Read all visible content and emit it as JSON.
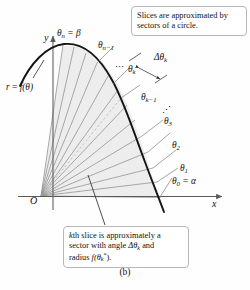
{
  "figure": {
    "caption": "(b)"
  },
  "callouts": {
    "top": "Slices are approximated by sectors of a circle.",
    "bottom_line1": "kth slice is approximately a",
    "bottom_line2_pre": "sector with angle ",
    "bottom_line2_delta": "Δθ",
    "bottom_line2_sub": "k",
    "bottom_line2_post": " and",
    "bottom_line3_pre": "radius ",
    "bottom_line3_f": "f",
    "bottom_line3_theta": "(θ",
    "bottom_line3_sub": "k",
    "bottom_line3_star": "*",
    "bottom_line3_post": ")."
  },
  "axes": {
    "x_label": "x",
    "y_label": "y",
    "origin_label": "O"
  },
  "curve": {
    "label_r": "r",
    "label_eq": " = ",
    "label_f": "f",
    "label_arg": "(θ)"
  },
  "ray_labels": [
    {
      "name": "theta-0",
      "base": "θ",
      "sub": "0",
      "tail": " = α"
    },
    {
      "name": "theta-1",
      "base": "θ",
      "sub": "1",
      "tail": ""
    },
    {
      "name": "theta-2",
      "base": "θ",
      "sub": "2",
      "tail": ""
    },
    {
      "name": "theta-3",
      "base": "θ",
      "sub": "3",
      "tail": ""
    },
    {
      "name": "theta-k-minus-1",
      "base": "θ",
      "sub": "k−1",
      "tail": ""
    },
    {
      "name": "theta-k",
      "base": "θ",
      "sub": "k",
      "tail": ""
    },
    {
      "name": "theta-n-minus-1",
      "base": "θ",
      "sub": "n−1",
      "tail": ""
    },
    {
      "name": "theta-n",
      "base": "θ",
      "sub": "n",
      "tail": " = β"
    }
  ],
  "delta_label": {
    "base": "Δθ",
    "sub": "k"
  },
  "ellipses": {
    "upper": "⋯",
    "lower": "⋰"
  },
  "colors": {
    "curve": "#141414",
    "axis": "#5a5a5a",
    "ray": "#8a8a8a",
    "shade": "#ececec",
    "callout_border": "#b8b8b8",
    "text": "#111111",
    "page": "#ffffff"
  }
}
